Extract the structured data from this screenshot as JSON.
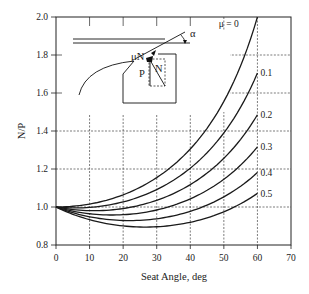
{
  "chart_data": {
    "type": "line",
    "title": "",
    "xlabel": "Seat Angle, deg",
    "ylabel": "N/P",
    "xlim": [
      0,
      70
    ],
    "ylim": [
      0.8,
      2.0
    ],
    "xticks": [
      0,
      10,
      20,
      30,
      40,
      50,
      60,
      70
    ],
    "yticks": [
      0.8,
      1.0,
      1.2,
      1.4,
      1.6,
      1.8,
      2.0
    ],
    "grid": true,
    "x": [
      0,
      5,
      10,
      15,
      20,
      25,
      30,
      35,
      40,
      45,
      50,
      55,
      60
    ],
    "series": [
      {
        "name": "μ = 0",
        "label": "μ = 0",
        "values": [
          1.0,
          1.004,
          1.015,
          1.035,
          1.064,
          1.103,
          1.155,
          1.221,
          1.305,
          1.414,
          1.556,
          1.743,
          2.0
        ]
      },
      {
        "name": "0.1",
        "label": "0.1",
        "values": [
          1.0,
          0.995,
          0.998,
          1.009,
          1.03,
          1.06,
          1.1,
          1.153,
          1.222,
          1.309,
          1.421,
          1.568,
          1.705
        ]
      },
      {
        "name": "0.2",
        "label": "0.2",
        "values": [
          1.0,
          0.986,
          0.981,
          0.985,
          0.998,
          1.02,
          1.05,
          1.093,
          1.15,
          1.219,
          1.308,
          1.392,
          1.486
        ]
      },
      {
        "name": "0.3",
        "label": "0.3",
        "values": [
          1.0,
          0.978,
          0.966,
          0.963,
          0.968,
          0.983,
          1.005,
          1.039,
          1.085,
          1.14,
          1.21,
          1.264,
          1.316
        ]
      },
      {
        "name": "0.4",
        "label": "0.4",
        "values": [
          1.0,
          0.969,
          0.951,
          0.942,
          0.941,
          0.949,
          0.964,
          0.99,
          1.027,
          1.071,
          1.115,
          1.148,
          1.181
        ]
      },
      {
        "name": "0.5",
        "label": "0.5",
        "values": [
          1.0,
          0.961,
          0.936,
          0.922,
          0.916,
          0.918,
          0.927,
          0.945,
          0.974,
          1.01,
          1.04,
          1.055,
          1.071
        ]
      }
    ],
    "annotations": [
      "μN",
      "P",
      "N",
      "α"
    ]
  },
  "inset": {
    "label_mu_n": "μN",
    "label_p": "P",
    "label_n": "N",
    "label_alpha": "α"
  },
  "colors": {
    "line": "#1a1a1a",
    "grid": "#444444",
    "background": "#ffffff"
  }
}
